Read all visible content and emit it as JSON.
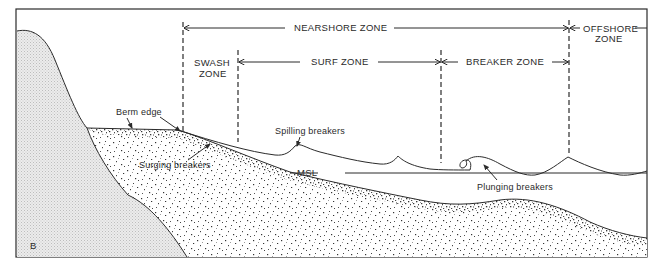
{
  "diagram": {
    "panel_label": "B",
    "zones": {
      "nearshore": "NEARSHORE ZONE",
      "offshore_line1": "OFFSHORE",
      "offshore_line2": "ZONE",
      "swash_line1": "SWASH",
      "swash_line2": "ZONE",
      "surf": "SURF ZONE",
      "breaker": "BREAKER ZONE"
    },
    "annotations": {
      "berm_edge": "Berm edge",
      "spilling_breakers": "Spilling breakers",
      "surging_breakers": "Surging breakers",
      "msl": "MSL",
      "plunging_breakers": "Plunging breakers"
    },
    "colors": {
      "line": "#2b2b2b",
      "bedrock_fill": "#e4e4e4",
      "sediment_fill": "#ffffff",
      "background": "#ffffff"
    }
  }
}
